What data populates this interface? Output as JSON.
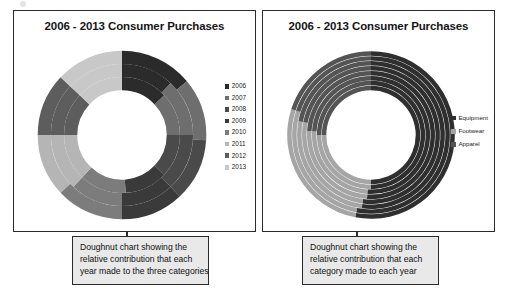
{
  "page": {
    "background": "#ffffff",
    "artifact_icon": "scan-speck-icon"
  },
  "panels": [
    {
      "id": "left",
      "title": "2006 - 2013 Consumer Purchases",
      "callout": {
        "lines": [
          "Doughnut chart showing the",
          "relative contribution that each",
          "year made to the three categories"
        ]
      },
      "legend": {
        "items": [
          {
            "label": "2006",
            "color": "#2b2b2b"
          },
          {
            "label": "2007",
            "color": "#6e6e6e"
          },
          {
            "label": "2008",
            "color": "#4a4a4a"
          },
          {
            "label": "2009",
            "color": "#3a3a3a"
          },
          {
            "label": "2010",
            "color": "#7c7c7c"
          },
          {
            "label": "2011",
            "color": "#b5b5b5"
          },
          {
            "label": "2012",
            "color": "#5d5d5d"
          },
          {
            "label": "2013",
            "color": "#c8c8c8"
          }
        ]
      }
    },
    {
      "id": "right",
      "title": "2006 - 2013 Consumer Purchases",
      "callout": {
        "lines": [
          "Doughnut chart showing the",
          "relative contribution that each",
          "category made to each year"
        ]
      },
      "legend": {
        "items": [
          {
            "label": "Equipment",
            "color": "#2f2f2f"
          },
          {
            "label": "Footwear",
            "color": "#a5a5a5"
          },
          {
            "label": "Apparel",
            "color": "#545454"
          }
        ]
      }
    }
  ],
  "chart_data": [
    {
      "type": "pie",
      "variant": "doughnut-multiring",
      "title": "2006 - 2013 Consumer Purchases",
      "description": "Doughnut chart showing the relative contribution that each year made to the three categories",
      "ring_meaning": "each ring is a category; slices within a ring are years",
      "rings": [
        {
          "name": "Apparel",
          "ring_index": 0,
          "categories": [
            "2006",
            "2007",
            "2008",
            "2009",
            "2010",
            "2011",
            "2012",
            "2013"
          ],
          "values": [
            13,
            12,
            12,
            12,
            13,
            13,
            12,
            13
          ],
          "colors": [
            "#2b2b2b",
            "#6e6e6e",
            "#4a4a4a",
            "#3a3a3a",
            "#7c7c7c",
            "#b5b5b5",
            "#5d5d5d",
            "#c8c8c8"
          ]
        },
        {
          "name": "Footwear",
          "ring_index": 1,
          "categories": [
            "2006",
            "2007",
            "2008",
            "2009",
            "2010",
            "2011",
            "2012",
            "2013"
          ],
          "values": [
            12,
            13,
            13,
            12,
            12,
            13,
            12,
            13
          ],
          "colors": [
            "#2b2b2b",
            "#6e6e6e",
            "#4a4a4a",
            "#3a3a3a",
            "#7c7c7c",
            "#b5b5b5",
            "#5d5d5d",
            "#c8c8c8"
          ]
        },
        {
          "name": "Equipment",
          "ring_index": 2,
          "categories": [
            "2006",
            "2007",
            "2008",
            "2009",
            "2010",
            "2011",
            "2012",
            "2013"
          ],
          "values": [
            14,
            12,
            12,
            12,
            13,
            12,
            12,
            13
          ],
          "colors": [
            "#2b2b2b",
            "#6e6e6e",
            "#4a4a4a",
            "#3a3a3a",
            "#7c7c7c",
            "#b5b5b5",
            "#5d5d5d",
            "#c8c8c8"
          ]
        }
      ],
      "legend": [
        "2006",
        "2007",
        "2008",
        "2009",
        "2010",
        "2011",
        "2012",
        "2013"
      ],
      "legend_position": "right",
      "grid": false
    },
    {
      "type": "pie",
      "variant": "doughnut-multiring",
      "title": "2006 - 2013 Consumer Purchases",
      "description": "Doughnut chart showing the relative contribution that each category made to each year",
      "ring_meaning": "each ring is a year; slices within a ring are categories",
      "rings": [
        {
          "name": "2006",
          "ring_index": 0,
          "categories": [
            "Equipment",
            "Footwear",
            "Apparel"
          ],
          "values": [
            50,
            25,
            25
          ],
          "colors": [
            "#2f2f2f",
            "#a5a5a5",
            "#545454"
          ]
        },
        {
          "name": "2007",
          "ring_index": 1,
          "categories": [
            "Equipment",
            "Footwear",
            "Apparel"
          ],
          "values": [
            50,
            25,
            25
          ],
          "colors": [
            "#2f2f2f",
            "#a5a5a5",
            "#545454"
          ]
        },
        {
          "name": "2008",
          "ring_index": 2,
          "categories": [
            "Equipment",
            "Footwear",
            "Apparel"
          ],
          "values": [
            51,
            25,
            24
          ],
          "colors": [
            "#2f2f2f",
            "#a5a5a5",
            "#545454"
          ]
        },
        {
          "name": "2009",
          "ring_index": 3,
          "categories": [
            "Equipment",
            "Footwear",
            "Apparel"
          ],
          "values": [
            51,
            25,
            24
          ],
          "colors": [
            "#2f2f2f",
            "#a5a5a5",
            "#545454"
          ]
        },
        {
          "name": "2010",
          "ring_index": 4,
          "categories": [
            "Equipment",
            "Footwear",
            "Apparel"
          ],
          "values": [
            52,
            26,
            22
          ],
          "colors": [
            "#2f2f2f",
            "#a5a5a5",
            "#545454"
          ]
        },
        {
          "name": "2011",
          "ring_index": 5,
          "categories": [
            "Equipment",
            "Footwear",
            "Apparel"
          ],
          "values": [
            52,
            26,
            22
          ],
          "colors": [
            "#2f2f2f",
            "#a5a5a5",
            "#545454"
          ]
        },
        {
          "name": "2012",
          "ring_index": 6,
          "categories": [
            "Equipment",
            "Footwear",
            "Apparel"
          ],
          "values": [
            53,
            27,
            20
          ],
          "colors": [
            "#2f2f2f",
            "#a5a5a5",
            "#545454"
          ]
        },
        {
          "name": "2013",
          "ring_index": 7,
          "categories": [
            "Equipment",
            "Footwear",
            "Apparel"
          ],
          "values": [
            53,
            27,
            20
          ],
          "colors": [
            "#2f2f2f",
            "#a5a5a5",
            "#545454"
          ]
        }
      ],
      "legend": [
        "Equipment",
        "Footwear",
        "Apparel"
      ],
      "legend_position": "right",
      "grid": false
    }
  ]
}
